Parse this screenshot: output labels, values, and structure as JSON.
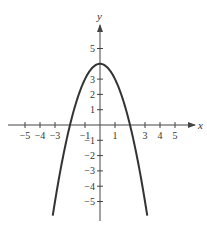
{
  "chart_data": {
    "type": "line",
    "title": "",
    "xlabel": "x",
    "ylabel": "y",
    "function": "y = 4 - x^2",
    "xlim": [
      -6,
      6.3
    ],
    "ylim": [
      -6.2,
      6.3
    ],
    "grid": false,
    "x_ticks": [
      -5,
      -4,
      -3,
      -1,
      1,
      3,
      4,
      5
    ],
    "x_tick_labels": [
      "−5",
      "−4",
      "−3",
      "−1",
      "1",
      "3",
      "4",
      "5"
    ],
    "y_ticks": [
      5,
      3,
      2,
      1,
      -1,
      -2,
      -3,
      -4,
      -5
    ],
    "y_tick_labels": [
      "5",
      "3",
      "2",
      "1",
      "−1",
      "−2",
      "−3",
      "−4",
      "−5"
    ],
    "series": [
      {
        "name": "parabola",
        "x": [
          -3.2,
          -3,
          -2.5,
          -2,
          -1.5,
          -1,
          -0.5,
          0,
          0.5,
          1,
          1.5,
          2,
          2.5,
          3,
          3.2
        ],
        "y": [
          -6.24,
          -5,
          -2.25,
          0,
          1.75,
          3,
          3.75,
          4,
          3.75,
          3,
          1.75,
          0,
          -2.25,
          -5,
          -6.24
        ]
      }
    ],
    "vertex": [
      0,
      4
    ],
    "x_intercepts": [
      -2,
      2
    ],
    "colors": {
      "curve": "#333333",
      "axis": "#444444"
    }
  }
}
